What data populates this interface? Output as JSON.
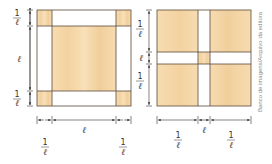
{
  "colors": {
    "wood": "#f7dcb0",
    "wood_dark": "#f0c98f",
    "strip": "#ffffff",
    "outline": "#5a4a3a",
    "dim": "#333333",
    "credit": "#8a8a8a"
  },
  "figure_left": {
    "description": "Square of side ℓ + 2/ℓ with four corner squares (1/ℓ) and a central ℓ × (ℓ+2/ℓ) vertical band shaded",
    "labels": {
      "left_top": {
        "num": "1",
        "den": "ℓ"
      },
      "left_mid": "ℓ",
      "left_bottom": {
        "num": "1",
        "den": "ℓ"
      },
      "bottom_left": {
        "num": "1",
        "den": "ℓ"
      },
      "bottom_mid": "ℓ",
      "bottom_right": {
        "num": "1",
        "den": "ℓ"
      }
    }
  },
  "figure_right": {
    "description": "Square divided by a central cross of width ℓ into four shaded squares of side 1/ℓ and a small central shaded square",
    "labels": {
      "left_top": {
        "num": "1",
        "den": "ℓ"
      },
      "left_mid": "ℓ",
      "left_bottom": {
        "num": "1",
        "den": "ℓ"
      },
      "bottom_left": {
        "num": "1",
        "den": "ℓ"
      },
      "bottom_mid": "ℓ",
      "bottom_right": {
        "num": "1",
        "den": "ℓ"
      }
    }
  },
  "credit": "Banco de imagens/Arquivo da editora"
}
